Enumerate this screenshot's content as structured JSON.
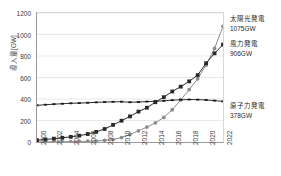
{
  "chart_data": {
    "type": "line",
    "title": "",
    "xlabel": "",
    "ylabel": "導入量[GW]",
    "ylim": [
      0,
      1200
    ],
    "y_ticks": [
      0,
      200,
      400,
      600,
      800,
      1000,
      1200
    ],
    "x": [
      2000,
      2001,
      2002,
      2003,
      2004,
      2005,
      2006,
      2007,
      2008,
      2009,
      2010,
      2011,
      2012,
      2013,
      2014,
      2015,
      2016,
      2017,
      2018,
      2019,
      2020,
      2021,
      2022
    ],
    "x_tick_labels": [
      "2000",
      "2002",
      "2004",
      "2006",
      "2008",
      "2010",
      "2012",
      "2014",
      "2016",
      "2018",
      "2020",
      "2022"
    ],
    "grid": "horizontal",
    "legend_position": "right-inline-annotations",
    "series": [
      {
        "name": "太陽光発電",
        "end_label": "1075GW",
        "color": "#8c8c8c",
        "marker": "circle",
        "values": [
          1,
          1,
          2,
          2,
          3,
          5,
          7,
          9,
          16,
          23,
          41,
          71,
          104,
          139,
          178,
          229,
          300,
          392,
          488,
          588,
          715,
          870,
          1075
        ]
      },
      {
        "name": "風力発電",
        "end_label": "906GW",
        "color": "#2a2a2a",
        "marker": "square",
        "values": [
          17,
          24,
          31,
          39,
          48,
          59,
          74,
          94,
          121,
          159,
          198,
          238,
          283,
          319,
          370,
          417,
          470,
          515,
          564,
          622,
          733,
          825,
          906
        ]
      },
      {
        "name": "原子力発電",
        "end_label": "378GW",
        "color": "#1a1a1a",
        "marker": "dash",
        "values": [
          341,
          347,
          352,
          356,
          360,
          362,
          365,
          369,
          372,
          374,
          375,
          370,
          372,
          376,
          379,
          383,
          389,
          393,
          395,
          394,
          391,
          385,
          378
        ]
      }
    ],
    "annotations": [
      {
        "name": "太陽光発電",
        "value": "1075GW",
        "top_px": 14
      },
      {
        "name": "風力発電",
        "value": "906GW",
        "top_px": 39
      },
      {
        "name": "原子力発電",
        "value": "378GW",
        "top_px": 101
      }
    ]
  }
}
